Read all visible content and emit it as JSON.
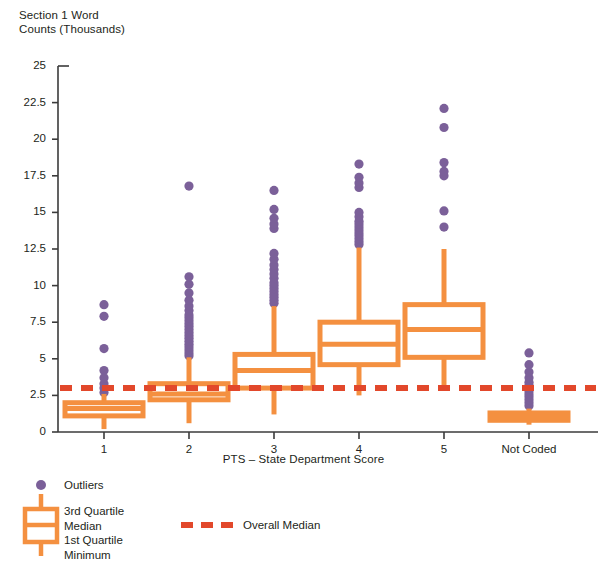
{
  "chart_data": {
    "type": "box",
    "title": "",
    "ylabel": "Section 1 Word\nCounts (Thousands)",
    "xlabel": "PTS – State Department Score",
    "categories": [
      "1",
      "2",
      "3",
      "4",
      "5",
      "Not Coded"
    ],
    "ylim": [
      0,
      25
    ],
    "yticks": [
      0,
      2.5,
      5,
      7.5,
      10,
      12.5,
      15,
      17.5,
      20,
      22.5,
      25
    ],
    "ytick_labels": [
      "0",
      "2.5",
      "5",
      "7.5",
      "10",
      "12.5",
      "15",
      "17.5",
      "20",
      "22.5",
      "25"
    ],
    "grid": false,
    "legend_position": "below-axis-left",
    "overall_median": 3.0,
    "boxes": [
      {
        "category": "1",
        "min": 0.2,
        "q1": 1.1,
        "median": 1.6,
        "q3": 2.0,
        "max": 2.6,
        "outliers": [
          2.7,
          3.0,
          3.3,
          3.7,
          4.2,
          5.7,
          7.9,
          8.7
        ]
      },
      {
        "category": "2",
        "min": 0.6,
        "q1": 2.2,
        "median": 2.6,
        "q3": 3.3,
        "max": 5.1,
        "outliers": [
          5.2,
          5.4,
          5.6,
          5.8,
          6.0,
          6.2,
          6.4,
          6.6,
          6.8,
          7.0,
          7.2,
          7.4,
          7.6,
          7.8,
          8.0,
          8.3,
          8.6,
          9.0,
          9.5,
          10.1,
          10.6,
          16.8
        ]
      },
      {
        "category": "3",
        "min": 1.2,
        "q1": 3.0,
        "median": 4.2,
        "q3": 5.3,
        "max": 8.6,
        "outliers": [
          8.8,
          9.0,
          9.2,
          9.4,
          9.6,
          9.8,
          10.0,
          10.2,
          10.5,
          10.8,
          11.1,
          11.4,
          11.8,
          12.2,
          13.9,
          14.2,
          14.6,
          15.2,
          16.5
        ]
      },
      {
        "category": "4",
        "min": 2.5,
        "q1": 4.6,
        "median": 6.0,
        "q3": 7.5,
        "max": 12.6,
        "outliers": [
          12.8,
          13.0,
          13.2,
          13.4,
          13.6,
          13.8,
          14.0,
          14.2,
          14.4,
          14.7,
          15.0,
          16.7,
          17.0,
          17.4,
          18.3
        ]
      },
      {
        "category": "5",
        "min": 2.9,
        "q1": 5.1,
        "median": 7.0,
        "q3": 8.7,
        "max": 12.5,
        "outliers": [
          14.0,
          15.1,
          17.5,
          17.8,
          18.4,
          20.8,
          22.1
        ]
      },
      {
        "category": "Not Coded",
        "min": 0.5,
        "q1": 0.8,
        "median": 1.1,
        "q3": 1.3,
        "max": 1.6,
        "outliers": [
          1.8,
          2.0,
          2.2,
          2.4,
          2.6,
          2.8,
          3.0,
          3.2,
          3.4,
          3.7,
          4.1,
          4.6,
          5.4
        ]
      }
    ]
  },
  "legend": {
    "outliers_label": "Outliers",
    "box_labels": "3rd Quartile\nMedian\n1st Quartile\nMinimum",
    "overall_median_label": "Overall Median"
  },
  "colors": {
    "box": "#F49040",
    "outlier": "#7B6099",
    "overall_median": "#E2482B",
    "axis": "#3b3b3b",
    "text": "#231f20"
  }
}
